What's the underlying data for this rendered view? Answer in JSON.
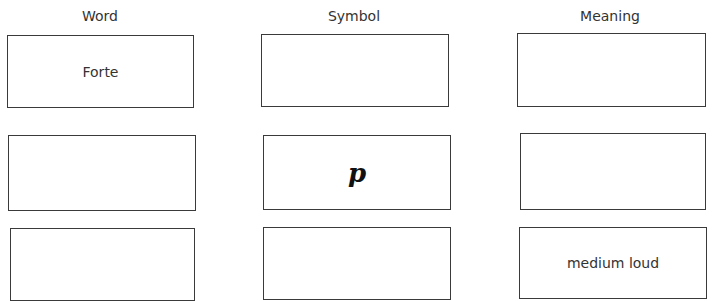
{
  "headers": {
    "word": "Word",
    "symbol": "Symbol",
    "meaning": "Meaning"
  },
  "rows": [
    {
      "word": "Forte",
      "symbol": "",
      "meaning": ""
    },
    {
      "word": "",
      "symbol": "p",
      "meaning": ""
    },
    {
      "word": "",
      "symbol": "",
      "meaning": "medium loud"
    }
  ]
}
